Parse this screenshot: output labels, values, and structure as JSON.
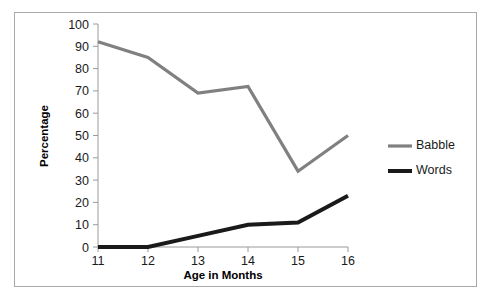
{
  "chart_data": {
    "type": "line",
    "title": "",
    "xlabel": "Age in Months",
    "ylabel": "Percentage",
    "categories": [
      "11",
      "12",
      "13",
      "14",
      "15",
      "16"
    ],
    "x": [
      11,
      12,
      13,
      14,
      15,
      16
    ],
    "xlim": [
      11,
      16
    ],
    "ylim": [
      0,
      100
    ],
    "yticks": [
      "0",
      "10",
      "20",
      "30",
      "40",
      "50",
      "60",
      "70",
      "80",
      "90",
      "100"
    ],
    "ytick_values": [
      0,
      10,
      20,
      30,
      40,
      50,
      60,
      70,
      80,
      90,
      100
    ],
    "grid": false,
    "legend_position": "right",
    "series": [
      {
        "name": "Babble",
        "color": "#808080",
        "line_width": 3.2,
        "values": [
          92,
          85,
          69,
          72,
          34,
          50
        ]
      },
      {
        "name": "Words",
        "color": "#1a1a1a",
        "line_width": 4.0,
        "values": [
          0,
          0,
          5,
          10,
          11,
          23
        ]
      }
    ]
  },
  "axes": {
    "y_title": "Percentage",
    "x_title": "Age in Months"
  },
  "legend": {
    "items": [
      {
        "label": "Babble",
        "color": "#808080"
      },
      {
        "label": "Words",
        "color": "#1a1a1a"
      }
    ]
  },
  "colors": {
    "babble": "#808080",
    "words": "#1a1a1a",
    "axis": "#9a9a9a",
    "frame_border": "#a8a8a8",
    "background": "#ffffff"
  },
  "geometry": {
    "plot_left": 98,
    "plot_right": 348,
    "plot_top": 24,
    "plot_bottom": 247,
    "y_min": 0,
    "y_max": 100,
    "x_min": 11,
    "x_max": 16
  }
}
